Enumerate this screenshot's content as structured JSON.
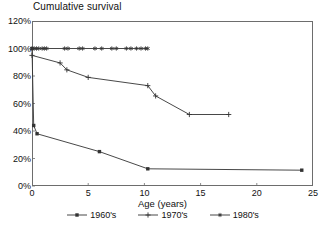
{
  "chart_data": {
    "type": "line",
    "title": "Cumulative survival",
    "xlabel": "Age (years)",
    "ylabel": "",
    "xlim": [
      0,
      25
    ],
    "ylim": [
      0,
      120
    ],
    "xticks": [
      0,
      5,
      10,
      15,
      20,
      25
    ],
    "xtick_labels": [
      "0",
      "5",
      "10",
      "15",
      "20",
      "25"
    ],
    "yticks": [
      0,
      20,
      40,
      60,
      80,
      100,
      120
    ],
    "ytick_labels": [
      "0%",
      "20%",
      "40%",
      "60%",
      "80%",
      "100%",
      "120%"
    ],
    "grid": false,
    "legend_position": "bottom",
    "series": [
      {
        "name": "1960's",
        "marker": "filled-square",
        "color": "#333333",
        "x": [
          0.0,
          0.15,
          0.45,
          6.0,
          10.3,
          24.0
        ],
        "y": [
          100,
          44,
          38,
          25,
          12.5,
          11.5
        ]
      },
      {
        "name": "1970's",
        "marker": "plus",
        "color": "#333333",
        "x": [
          0.0,
          2.5,
          3.1,
          5.0,
          10.3,
          11.0,
          14.0,
          17.5
        ],
        "y": [
          95,
          89.5,
          84.5,
          79,
          73,
          65.5,
          52,
          52
        ]
      },
      {
        "name": "1980's",
        "marker": "asterisk",
        "color": "#333333",
        "x": [
          0.0,
          0.2,
          0.4,
          0.6,
          0.9,
          1.1,
          1.3,
          2.9,
          3.2,
          4.2,
          4.5,
          5.6,
          6.2,
          7.1,
          7.5,
          8.4,
          8.8,
          9.3,
          9.7,
          10.1,
          10.3
        ],
        "y": [
          100,
          100,
          100,
          100,
          100,
          100,
          100,
          100,
          100,
          100,
          100,
          100,
          100,
          100,
          100,
          100,
          100,
          100,
          100,
          100,
          100
        ]
      }
    ]
  },
  "legend": {
    "items": [
      {
        "label": "1960's",
        "marker": "filled-square"
      },
      {
        "label": "1970's",
        "marker": "plus"
      },
      {
        "label": "1980's",
        "marker": "asterisk"
      }
    ]
  },
  "colors": {
    "line": "#333333",
    "axis": "#6d6d6d",
    "text": "#111111",
    "background": "#ffffff"
  }
}
